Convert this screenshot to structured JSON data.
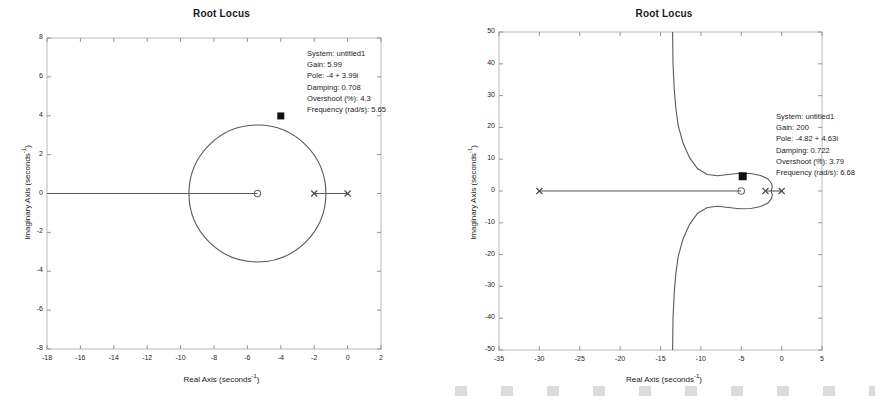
{
  "figures": [
    {
      "id": "left",
      "title": "Root Locus",
      "xlabel_text": "Real Axis (seconds",
      "xlabel_sup": "-1",
      "xlabel_tail": ")",
      "ylabel_text": "Imaginary Axis (seconds",
      "ylabel_sup": "-1",
      "ylabel_tail": ")",
      "datatip": {
        "system": "System: untitled1",
        "gain": "Gain: 5.99",
        "pole": "Pole: -4 + 3.99i",
        "damping": "Damping: 0.708",
        "overshoot": "Overshoot (%): 4.3",
        "frequency": "Frequency (rad/s): 5.65"
      }
    },
    {
      "id": "right",
      "title": "Root Locus",
      "xlabel_text": "Real Axis (seconds",
      "xlabel_sup": "-1",
      "xlabel_tail": ")",
      "ylabel_text": "Imaginary Axis (seconds",
      "ylabel_sup": "-1",
      "ylabel_tail": ")",
      "datatip": {
        "system": "System: untitled1",
        "gain": "Gain: 200",
        "pole": "Pole: -4.82 + 4.63i",
        "damping": "Damping: 0.722",
        "overshoot": "Overshoot (%): 3.79",
        "frequency": "Frequency (rad/s): 6.68"
      }
    }
  ],
  "chart_data": [
    {
      "type": "line",
      "title": "Root Locus",
      "xlabel": "Real Axis (seconds^-1)",
      "ylabel": "Imaginary Axis (seconds^-1)",
      "xlim": [
        -18,
        2
      ],
      "ylim": [
        -8,
        8
      ],
      "xticks": [
        -18,
        -16,
        -14,
        -12,
        -10,
        -8,
        -6,
        -4,
        -2,
        0,
        2
      ],
      "yticks": [
        8,
        6,
        4,
        2,
        0,
        -2,
        -4,
        -6,
        -8
      ],
      "grid": false,
      "legend": "none",
      "poles": [
        {
          "x": -2,
          "y": 0,
          "marker": "x"
        },
        {
          "x": 0,
          "y": 0,
          "marker": "x"
        }
      ],
      "zeros": [
        {
          "x": -5.4,
          "y": 0,
          "marker": "o"
        }
      ],
      "branches": [
        {
          "name": "circle-locus",
          "shape": "circle",
          "center_x": -5.4,
          "center_y": 0,
          "radius": 4.1
        },
        {
          "name": "real-axis-left",
          "shape": "segment",
          "from": [
            -18,
            0
          ],
          "to": [
            -5.4,
            0
          ]
        },
        {
          "name": "real-axis-right",
          "shape": "segment",
          "from": [
            -2,
            0
          ],
          "to": [
            0,
            0
          ]
        }
      ],
      "selected_point": {
        "x": -4,
        "y": 3.99,
        "marker": "filled-square"
      },
      "annotations": [
        "System: untitled1",
        "Gain: 5.99",
        "Pole: -4 + 3.99i",
        "Damping: 0.708",
        "Overshoot (%): 4.3",
        "Frequency (rad/s): 5.65"
      ]
    },
    {
      "type": "line",
      "title": "Root Locus",
      "xlabel": "Real Axis (seconds^-1)",
      "ylabel": "Imaginary Axis (seconds^-1)",
      "xlim": [
        -35,
        5
      ],
      "ylim": [
        -50,
        50
      ],
      "xticks": [
        -35,
        -30,
        -25,
        -20,
        -15,
        -10,
        -5,
        0,
        5
      ],
      "yticks": [
        50,
        40,
        30,
        20,
        10,
        0,
        -10,
        -20,
        -30,
        -40,
        -50
      ],
      "grid": false,
      "legend": "none",
      "poles": [
        {
          "x": -30,
          "y": 0,
          "marker": "x"
        },
        {
          "x": -2,
          "y": 0,
          "marker": "x"
        },
        {
          "x": 0,
          "y": 0,
          "marker": "x"
        }
      ],
      "zeros": [
        {
          "x": -5,
          "y": 0,
          "marker": "o"
        }
      ],
      "branches": [
        {
          "name": "asymptote-upper",
          "shape": "curve",
          "description": "branch rising from near (-1.5, 0) through (-5, 5.5) to (-13.5, 50)"
        },
        {
          "name": "asymptote-lower",
          "shape": "curve",
          "description": "mirror of upper branch below real axis to (-13.5, -50)"
        },
        {
          "name": "real-axis-left",
          "shape": "segment",
          "from": [
            -30,
            0
          ],
          "to": [
            -5,
            0
          ]
        },
        {
          "name": "real-axis-right",
          "shape": "segment",
          "from": [
            -2,
            0
          ],
          "to": [
            0,
            0
          ]
        }
      ],
      "selected_point": {
        "x": -4.82,
        "y": 4.63,
        "marker": "filled-square"
      },
      "annotations": [
        "System: untitled1",
        "Gain: 200",
        "Pole: -4.82 + 4.63i",
        "Damping: 0.722",
        "Overshoot (%): 3.79",
        "Frequency (rad/s): 6.68"
      ]
    }
  ]
}
